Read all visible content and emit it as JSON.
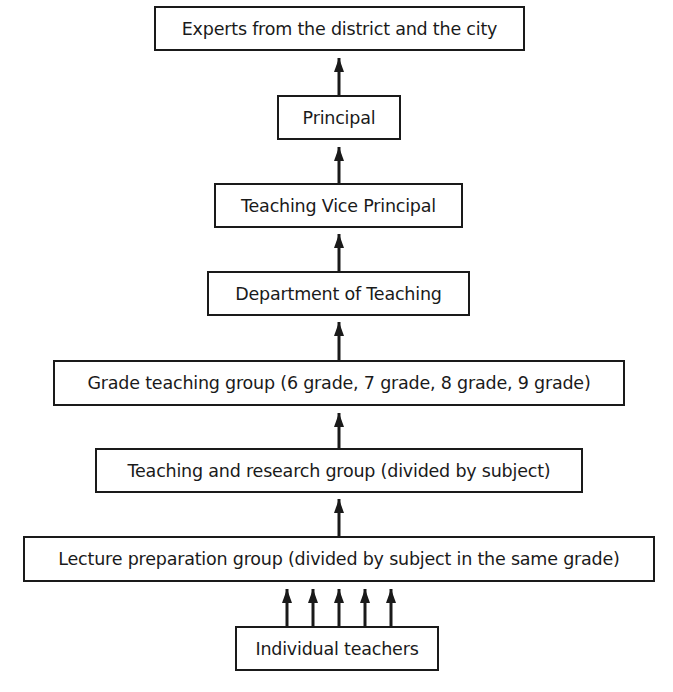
{
  "diagram": {
    "type": "hierarchy-flowchart",
    "direction": "bottom-to-top",
    "colors": {
      "stroke": "#1a1a1a",
      "background": "#ffffff",
      "text": "#1a1a1a"
    },
    "nodes": [
      {
        "id": "experts",
        "label": "Experts from the district and the city"
      },
      {
        "id": "principal",
        "label": "Principal"
      },
      {
        "id": "vice_principal",
        "label": "Teaching Vice Principal"
      },
      {
        "id": "department",
        "label": "Department of Teaching"
      },
      {
        "id": "grade_group",
        "label": "Grade teaching group (6 grade, 7 grade, 8 grade, 9 grade)"
      },
      {
        "id": "research_group",
        "label": "Teaching and research group (divided by subject)"
      },
      {
        "id": "lecture_group",
        "label": "Lecture preparation group (divided by subject in the same grade)"
      },
      {
        "id": "teachers",
        "label": "Individual teachers"
      }
    ],
    "edges": [
      {
        "from": "principal",
        "to": "experts"
      },
      {
        "from": "vice_principal",
        "to": "principal"
      },
      {
        "from": "department",
        "to": "vice_principal"
      },
      {
        "from": "grade_group",
        "to": "department"
      },
      {
        "from": "research_group",
        "to": "grade_group"
      },
      {
        "from": "lecture_group",
        "to": "research_group"
      },
      {
        "from": "teachers",
        "to": "lecture_group",
        "count": 5
      }
    ]
  }
}
